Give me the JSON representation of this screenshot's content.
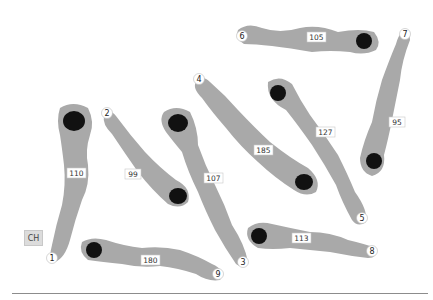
{
  "colors": {
    "body": "#a9a9a9",
    "nucleus": "#111111",
    "label_bg": "#ffffff",
    "label_border": "#c8c8c8",
    "text": "#333333",
    "baseline": "#8c8c8c"
  },
  "legend_box": {
    "label": "CH"
  },
  "cells": [
    {
      "id": "1",
      "length": "110"
    },
    {
      "id": "2",
      "length": "99"
    },
    {
      "id": "3",
      "length": "107"
    },
    {
      "id": "4",
      "length": "185"
    },
    {
      "id": "5",
      "length": "127"
    },
    {
      "id": "6",
      "length": "105"
    },
    {
      "id": "7",
      "length": "95"
    },
    {
      "id": "8",
      "length": "113"
    },
    {
      "id": "9",
      "length": "180"
    }
  ]
}
